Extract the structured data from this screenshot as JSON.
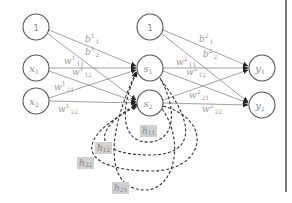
{
  "diagram": {
    "type": "recurrent-neural-network",
    "layers": {
      "input": [
        {
          "id": "bias1",
          "label": "1"
        },
        {
          "id": "x1",
          "label": "x",
          "sub": "1"
        },
        {
          "id": "x2",
          "label": "x",
          "sub": "2"
        }
      ],
      "hidden": [
        {
          "id": "bias2",
          "label": "1"
        },
        {
          "id": "s1",
          "label": "s",
          "sub": "1"
        },
        {
          "id": "s2",
          "label": "s",
          "sub": "2"
        }
      ],
      "output": [
        {
          "id": "y1",
          "label": "y",
          "sub": "1"
        },
        {
          "id": "y2",
          "label": "y",
          "sub": "2"
        }
      ]
    },
    "edge_labels": {
      "b1_1": {
        "base": "b",
        "sup": "1",
        "sub": "1"
      },
      "b1_2": {
        "base": "b",
        "sup": "1",
        "sub": "2"
      },
      "w1_11": {
        "base": "w",
        "sup": "1",
        "sub": "11"
      },
      "w1_12": {
        "base": "w",
        "sup": "1",
        "sub": "12"
      },
      "w1_21": {
        "base": "w",
        "sup": "1",
        "sub": "21"
      },
      "w1_22": {
        "base": "w",
        "sup": "1",
        "sub": "22"
      },
      "b2_1": {
        "base": "b",
        "sup": "2",
        "sub": "1"
      },
      "b2_2": {
        "base": "b",
        "sup": "2",
        "sub": "2"
      },
      "w2_11": {
        "base": "w",
        "sup": "2",
        "sub": "11"
      },
      "w2_12": {
        "base": "w",
        "sup": "2",
        "sub": "12"
      },
      "w2_21": {
        "base": "w",
        "sup": "2",
        "sub": "21"
      },
      "w2_22": {
        "base": "w",
        "sup": "2",
        "sub": "22"
      }
    },
    "recurrent_labels": {
      "h11": {
        "base": "h",
        "sub": "11"
      },
      "h12": {
        "base": "h",
        "sub": "12"
      },
      "h22": {
        "base": "h",
        "sub": "22"
      },
      "h21": {
        "base": "h",
        "sub": "21"
      }
    }
  }
}
